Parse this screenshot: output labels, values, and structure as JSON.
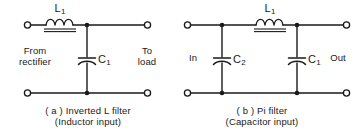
{
  "figure": {
    "background_color": "#ffffff",
    "ink_color": "#1a1a1a"
  },
  "circuits": [
    {
      "id": "inverted-l-filter",
      "caption_line1": "( a ) Inverted L filter",
      "caption_line2": "(Inductor input)",
      "port_left": "From\nrectifier",
      "port_left_line1": "From",
      "port_left_line2": "rectifier",
      "port_right_line1": "To",
      "port_right_line2": "load",
      "components": [
        {
          "ref": "L",
          "sub": "1",
          "type": "inductor",
          "note": "iron-core choke, series element"
        },
        {
          "ref": "C",
          "sub": "1",
          "type": "capacitor",
          "note": "shunt element to bottom rail"
        }
      ],
      "terminals": 4,
      "junction_dots": 2
    },
    {
      "id": "pi-filter",
      "caption_line1": "( b ) Pi filter",
      "caption_line2": "(Capacitor input)",
      "port_left_line1": "In",
      "port_left_line2": "",
      "port_right_line1": "Out",
      "port_right_line2": "",
      "components": [
        {
          "ref": "C",
          "sub": "2",
          "type": "capacitor",
          "note": "input shunt capacitor"
        },
        {
          "ref": "L",
          "sub": "1",
          "type": "inductor",
          "note": "iron-core choke, series element"
        },
        {
          "ref": "C",
          "sub": "1",
          "type": "capacitor",
          "note": "output shunt capacitor"
        }
      ],
      "terminals": 4,
      "junction_dots": 4
    }
  ],
  "labels": {
    "a_inductor_ref": "L",
    "a_inductor_sub": "1",
    "a_capacitor_ref": "C",
    "a_capacitor_sub": "1",
    "a_port_left_1": "From",
    "a_port_left_2": "rectifier",
    "a_port_right_1": "To",
    "a_port_right_2": "load",
    "a_caption_1": "( a ) Inverted L filter",
    "a_caption_2": "(Inductor input)",
    "b_inductor_ref": "L",
    "b_inductor_sub": "1",
    "b_capacitor2_ref": "C",
    "b_capacitor2_sub": "2",
    "b_capacitor1_ref": "C",
    "b_capacitor1_sub": "1",
    "b_port_left": "In",
    "b_port_right": "Out",
    "b_caption_1": "( b ) Pi filter",
    "b_caption_2": "(Capacitor input)"
  }
}
